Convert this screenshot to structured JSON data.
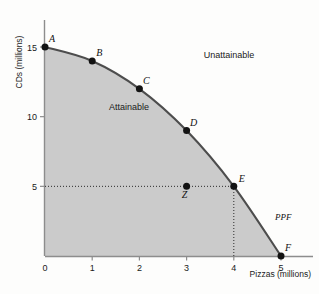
{
  "chart_data": {
    "type": "line",
    "title": "",
    "xlabel": "Pizzas (millions)",
    "ylabel": "CDs (millions)",
    "xlim": [
      0,
      5.3
    ],
    "ylim": [
      0,
      16.5
    ],
    "xticks": [
      0,
      1,
      2,
      3,
      4,
      5
    ],
    "xtick_labels": [
      "0",
      "1",
      "2",
      "3",
      "4",
      "5"
    ],
    "yticks": [
      5,
      10,
      15
    ],
    "ytick_labels": [
      "5",
      "10",
      "15"
    ],
    "grid": false,
    "legend": "none",
    "series": [
      {
        "name": "PPF",
        "label": "PPF",
        "x": [
          0,
          1,
          2,
          3,
          4,
          5
        ],
        "values": [
          15,
          14,
          12,
          9,
          5,
          0
        ]
      }
    ],
    "points": [
      {
        "name": "A",
        "x": 0,
        "y": 15,
        "label_dx": 7,
        "label_dy": -5
      },
      {
        "name": "B",
        "x": 1,
        "y": 14,
        "label_dx": 7,
        "label_dy": -5
      },
      {
        "name": "C",
        "x": 2,
        "y": 12,
        "label_dx": 7,
        "label_dy": -5
      },
      {
        "name": "D",
        "x": 3,
        "y": 9,
        "label_dx": 7,
        "label_dy": -5
      },
      {
        "name": "E",
        "x": 4,
        "y": 5,
        "label_dx": 8,
        "label_dy": -4
      },
      {
        "name": "F",
        "x": 5,
        "y": 0,
        "label_dx": 7,
        "label_dy": -5
      },
      {
        "name": "Z",
        "x": 3,
        "y": 5,
        "label_dx": -2,
        "label_dy": 12
      }
    ],
    "annotations": [
      {
        "name": "attainable",
        "text": "Attainable",
        "x": 1.78,
        "y": 10.5
      },
      {
        "name": "unattainable",
        "text": "Unattainable",
        "x": 3.9,
        "y": 14.2
      },
      {
        "name": "ppf",
        "text": "PPF",
        "x": 5.05,
        "y": 2.6
      }
    ],
    "guides": [
      {
        "name": "z-e-horizontal",
        "type": "horizontal",
        "y": 5,
        "x_from": 0,
        "x_to": 4
      },
      {
        "name": "e-vertical",
        "type": "vertical",
        "x": 4,
        "y_from": 0,
        "y_to": 5
      }
    ],
    "colors": {
      "attainable_fill": "#cbcbcb",
      "curve": "#4d4d4d",
      "axis": "#8d8d8d",
      "point": "#131313",
      "text": "#1a1a1a",
      "background": "#fdfdfc"
    }
  }
}
